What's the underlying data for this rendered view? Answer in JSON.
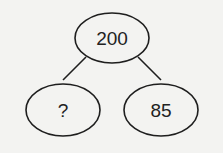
{
  "diagram": {
    "type": "number-bond",
    "whole": "200",
    "parts": [
      "?",
      "85"
    ],
    "colors": {
      "background": "#f3f3f1",
      "stroke": "#1e1e1e",
      "text": "#222222"
    }
  }
}
